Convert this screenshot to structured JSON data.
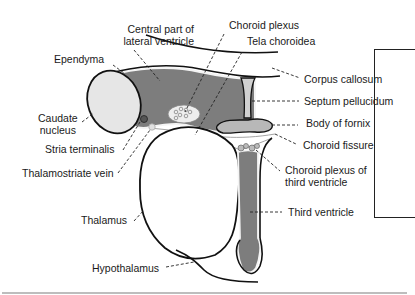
{
  "figure": {
    "colors": {
      "ventricle_fill": "#7a7a7a",
      "ependyma_outline": "#f4f4f4",
      "caudate_fill": "#e6e6e6",
      "fornix_fill": "#bdbdbd",
      "outline": "#111111"
    }
  },
  "labels": {
    "central_part_lateral_ventricle": [
      "Central part of",
      "lateral ventricle"
    ],
    "ependyma": "Ependyma",
    "caudate_nucleus": [
      "Caudate",
      "nucleus"
    ],
    "stria_terminalis": "Stria terminalis",
    "thalamostriate_vein": "Thalamostriate vein",
    "thalamus": "Thalamus",
    "hypothalamus": "Hypothalamus",
    "choroid_plexus": "Choroid plexus",
    "tela_choroidea": "Tela choroidea",
    "corpus_callosum": "Corpus callosum",
    "septum_pellucidum": "Septum pellucidum",
    "body_of_fornix": "Body of fornix",
    "choroid_fissure": "Choroid fissure",
    "choroid_plexus_third_ventricle": [
      "Choroid plexus of",
      "third ventricle"
    ],
    "third_ventricle": "Third ventricle"
  }
}
